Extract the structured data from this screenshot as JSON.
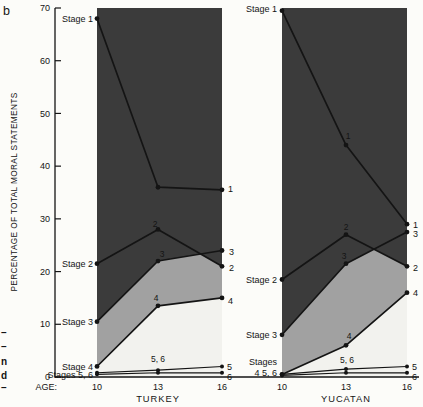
{
  "figure": {
    "panel_letter": "b",
    "left_margin_fragments": [
      "–",
      "–",
      "n",
      "d",
      "–"
    ]
  },
  "chart_data": {
    "type": "line",
    "title": "",
    "ylabel": "PERCENTAGE OF TOTAL MORAL STATEMENTS",
    "age_axis_prefix": "AGE:",
    "x": [
      "10",
      "13",
      "16"
    ],
    "ylim": [
      0,
      70
    ],
    "yticks": [
      0,
      10,
      20,
      30,
      40,
      50,
      60,
      70
    ],
    "grid": false,
    "legend": "inline-labels",
    "band_colors": {
      "upper_dark": "#3b3b3b",
      "middle_gray": "#a1a1a1",
      "lower_light": "#f2f2ee"
    },
    "line_color": "#141414",
    "panels": [
      {
        "name": "TURKEY",
        "series": [
          {
            "name": "Stage 1",
            "values": [
              68,
              36,
              35.5
            ]
          },
          {
            "name": "Stage 2",
            "values": [
              21.5,
              28,
              21
            ]
          },
          {
            "name": "Stage 3",
            "values": [
              10.5,
              22,
              24
            ]
          },
          {
            "name": "Stage 4",
            "values": [
              2,
              13.5,
              15
            ]
          },
          {
            "name": "Stage 5",
            "values": [
              0.8,
              1.3,
              2
            ]
          },
          {
            "name": "Stage 6",
            "values": [
              0.5,
              0.8,
              0.8
            ]
          }
        ],
        "annotations": [
          {
            "text": "Stage 1",
            "x": 93,
            "y": 21.5,
            "anchor": "end",
            "size": 9
          },
          {
            "text": "Stage 2",
            "x": 93,
            "y": 267,
            "anchor": "end",
            "size": 9
          },
          {
            "text": "Stage 3",
            "x": 93,
            "y": 325,
            "anchor": "end",
            "size": 9
          },
          {
            "text": "Stage 4",
            "x": 93,
            "y": 369.5,
            "anchor": "end",
            "size": 9
          },
          {
            "text": "Stages 5, 6",
            "x": 93,
            "y": 377.5,
            "anchor": "end",
            "size": 9
          },
          {
            "text": "2",
            "x": 155,
            "y": 227,
            "anchor": "middle",
            "size": 8.5
          },
          {
            "text": "3",
            "x": 162,
            "y": 257,
            "anchor": "middle",
            "size": 8.5
          },
          {
            "text": "4",
            "x": 156,
            "y": 301,
            "anchor": "middle",
            "size": 8.5
          },
          {
            "text": "5, 6",
            "x": 158,
            "y": 362,
            "anchor": "middle",
            "size": 8.5
          },
          {
            "text": "1",
            "x": 228,
            "y": 192,
            "anchor": "start",
            "size": 9
          },
          {
            "text": "3",
            "x": 229,
            "y": 255,
            "anchor": "start",
            "size": 9
          },
          {
            "text": "2",
            "x": 229,
            "y": 270.5,
            "anchor": "start",
            "size": 9
          },
          {
            "text": "4",
            "x": 228,
            "y": 303.5,
            "anchor": "start",
            "size": 9
          },
          {
            "text": "5",
            "x": 227,
            "y": 369.5,
            "anchor": "start",
            "size": 9
          },
          {
            "text": "6",
            "x": 227,
            "y": 379.5,
            "anchor": "start",
            "size": 9
          }
        ]
      },
      {
        "name": "YUCATAN",
        "series": [
          {
            "name": "Stage 1",
            "values": [
              69.5,
              44,
              29
            ]
          },
          {
            "name": "Stage 2",
            "values": [
              18.5,
              27,
              21
            ]
          },
          {
            "name": "Stage 3",
            "values": [
              8,
              21.5,
              27.5
            ]
          },
          {
            "name": "Stage 4",
            "values": [
              0.5,
              6,
              16
            ]
          },
          {
            "name": "Stage 5",
            "values": [
              0.5,
              1.5,
              2
            ]
          },
          {
            "name": "Stage 6",
            "values": [
              0.3,
              0.8,
              0.8
            ]
          }
        ],
        "annotations": [
          {
            "text": "Stage 1",
            "x": 277,
            "y": 12,
            "anchor": "end",
            "size": 9
          },
          {
            "text": "Stage 2",
            "x": 277,
            "y": 283,
            "anchor": "end",
            "size": 9
          },
          {
            "text": "Stage 3",
            "x": 277,
            "y": 337.5,
            "anchor": "end",
            "size": 9
          },
          {
            "text": "Stages",
            "x": 277,
            "y": 365,
            "anchor": "end",
            "size": 9
          },
          {
            "text": "4  5, 6",
            "x": 277,
            "y": 375.5,
            "anchor": "end",
            "size": 9
          },
          {
            "text": "1",
            "x": 348,
            "y": 139,
            "anchor": "middle",
            "size": 8.5
          },
          {
            "text": "2",
            "x": 346,
            "y": 230,
            "anchor": "middle",
            "size": 8.5
          },
          {
            "text": "3",
            "x": 344,
            "y": 259,
            "anchor": "middle",
            "size": 8.5
          },
          {
            "text": "4",
            "x": 349,
            "y": 339,
            "anchor": "middle",
            "size": 8.5
          },
          {
            "text": "5, 6",
            "x": 347,
            "y": 363,
            "anchor": "middle",
            "size": 8.5
          },
          {
            "text": "1",
            "x": 413,
            "y": 228,
            "anchor": "start",
            "size": 9
          },
          {
            "text": "3",
            "x": 413,
            "y": 237,
            "anchor": "start",
            "size": 9
          },
          {
            "text": "2",
            "x": 413,
            "y": 271,
            "anchor": "start",
            "size": 9
          },
          {
            "text": "4",
            "x": 413,
            "y": 296,
            "anchor": "start",
            "size": 9
          },
          {
            "text": "5",
            "x": 412,
            "y": 370,
            "anchor": "start",
            "size": 9
          },
          {
            "text": "6",
            "x": 412,
            "y": 380,
            "anchor": "start",
            "size": 9
          }
        ]
      }
    ]
  }
}
